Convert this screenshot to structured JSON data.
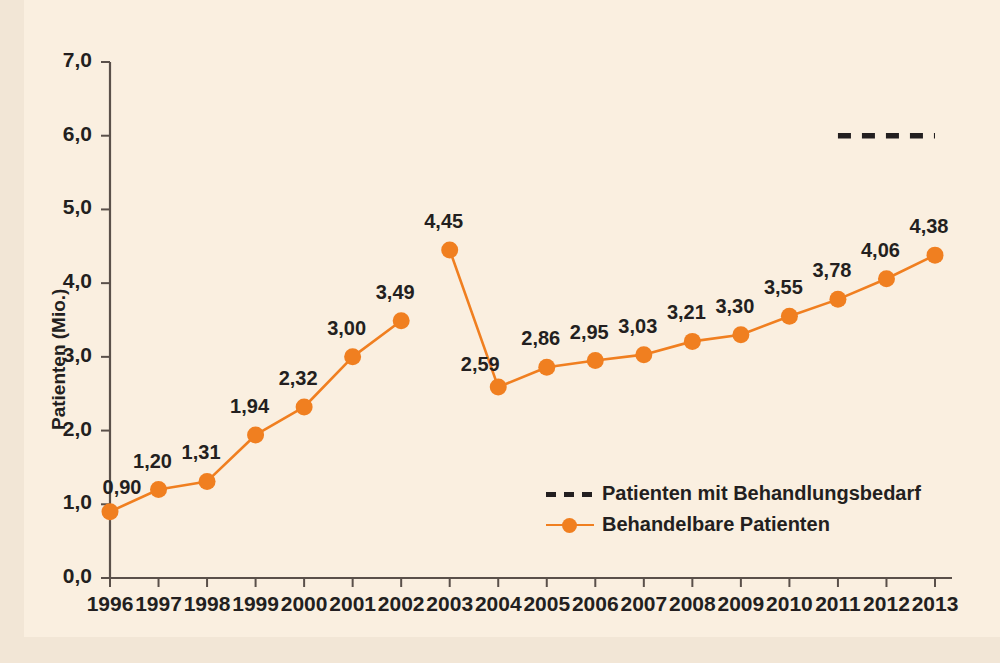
{
  "figure": {
    "background_color": "#f2e6d6",
    "plate_color": "#faefe0",
    "accent_color": "#f07f20",
    "text_color": "#231f20"
  },
  "axes": {
    "ylabel": "Patienten (Mio.)",
    "yticks": [
      "0,0",
      "1,0",
      "2,0",
      "3,0",
      "4,0",
      "5,0",
      "6,0",
      "7,0"
    ],
    "xticks": [
      "1996",
      "1997",
      "1998",
      "1999",
      "2000",
      "2001",
      "2002",
      "2003",
      "2004",
      "2005",
      "2006",
      "2007",
      "2008",
      "2009",
      "2010",
      "2011",
      "2012",
      "2013"
    ]
  },
  "legend": {
    "items": [
      {
        "label": "Patienten mit Behandlungsbedarf",
        "style": "dashed",
        "color": "#231f20"
      },
      {
        "label": "Behandelbare Patienten",
        "style": "line-marker",
        "color": "#f07f20"
      }
    ]
  },
  "point_labels": [
    "0,90",
    "1,20",
    "1,31",
    "1,94",
    "2,32",
    "3,00",
    "3,49",
    "4,45",
    "2,59",
    "2,86",
    "2,95",
    "3,03",
    "3,21",
    "3,30",
    "3,55",
    "3,78",
    "4,06",
    "4,38"
  ],
  "chart_data": {
    "type": "line",
    "title": "",
    "xlabel": "",
    "ylabel": "Patienten (Mio.)",
    "x": [
      1996,
      1997,
      1998,
      1999,
      2000,
      2001,
      2002,
      2003,
      2004,
      2005,
      2006,
      2007,
      2008,
      2009,
      2010,
      2011,
      2012,
      2013
    ],
    "xlim": [
      1996,
      2013
    ],
    "ylim": [
      0.0,
      7.0
    ],
    "ytick_values": [
      0.0,
      1.0,
      2.0,
      3.0,
      4.0,
      5.0,
      6.0,
      7.0
    ],
    "grid": false,
    "legend_position": "inside-lower-right",
    "series": [
      {
        "name": "Behandelbare Patienten",
        "color": "#f07f20",
        "style": "solid-with-markers",
        "marker": "circle",
        "values": [
          0.9,
          1.2,
          1.31,
          1.94,
          2.32,
          3.0,
          3.49,
          4.45,
          2.59,
          2.86,
          2.95,
          3.03,
          3.21,
          3.3,
          3.55,
          3.78,
          4.06,
          4.38
        ],
        "labels": [
          "0,90",
          "1,20",
          "1,31",
          "1,94",
          "2,32",
          "3,00",
          "3,49",
          "4,45",
          "2,59",
          "2,86",
          "2,95",
          "3,03",
          "3,21",
          "3,30",
          "3,55",
          "3,78",
          "4,06",
          "4,38"
        ],
        "break_between": [
          2002,
          2003
        ]
      },
      {
        "name": "Patienten mit Behandlungsbedarf",
        "color": "#231f20",
        "style": "dashed",
        "values": [
          null,
          null,
          null,
          null,
          null,
          null,
          null,
          null,
          null,
          null,
          null,
          null,
          null,
          null,
          null,
          6.0,
          6.0,
          6.0
        ],
        "segment_x": [
          2011,
          2013
        ],
        "segment_y": 6.0
      }
    ]
  }
}
